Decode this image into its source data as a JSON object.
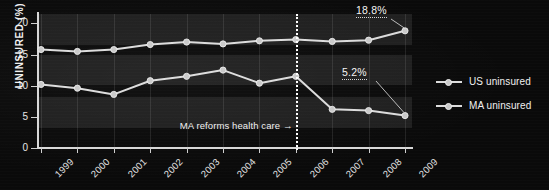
{
  "chart_data": {
    "type": "line",
    "title": "",
    "xlabel": "",
    "ylabel": "UNINSURED (%)",
    "categories": [
      "1999",
      "2000",
      "2001",
      "2002",
      "2003",
      "2004",
      "2005",
      "2006",
      "2007",
      "2008",
      "2009"
    ],
    "ylim": [
      0,
      21.5
    ],
    "yticks": [
      "0",
      "5",
      "10",
      "15",
      "20"
    ],
    "ytick_values": [
      0,
      5,
      10,
      15,
      20
    ],
    "grid": "vertical-only",
    "legend_position": "right",
    "series": [
      {
        "name": "US uninsured",
        "values": [
          15.8,
          15.5,
          15.8,
          16.6,
          17.0,
          16.7,
          17.2,
          17.4,
          17.1,
          17.3,
          18.8
        ]
      },
      {
        "name": "MA uninsured",
        "values": [
          10.2,
          9.6,
          8.6,
          10.8,
          11.5,
          12.5,
          10.4,
          11.5,
          6.2,
          6.0,
          5.2
        ]
      }
    ],
    "annotations": [
      {
        "name": "us-final-value",
        "text": "18.8%",
        "series": "US uninsured",
        "x": "2009",
        "value": 18.8
      },
      {
        "name": "ma-final-value",
        "text": "5.2%",
        "series": "MA uninsured",
        "x": "2009",
        "value": 5.2
      },
      {
        "name": "reform-marker",
        "text": "MA reforms health care →",
        "x": "2006"
      }
    ]
  },
  "legend": {
    "items": [
      {
        "label": "US uninsured"
      },
      {
        "label": "MA uninsured"
      }
    ]
  },
  "colors": {
    "background": "#0a0a0a",
    "line": "#dcdcdc",
    "marker": "#c9c9c9",
    "axis": "#d8d8d8",
    "text": "#f0f0f0",
    "band": "rgba(255,255,255,0.085)"
  }
}
